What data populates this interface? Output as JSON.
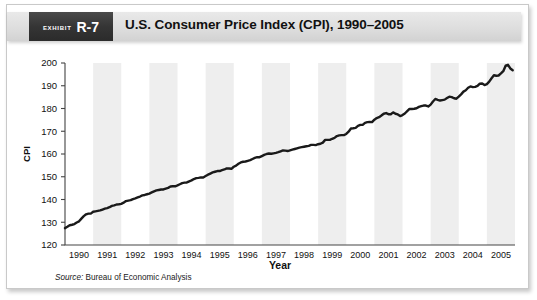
{
  "figure": {
    "exhibit_word": "Exhibit",
    "exhibit_number": "R-7",
    "title": "U.S. Consumer Price Index (CPI), 1990–2005",
    "source_label": "Source:",
    "source_text": "Bureau of Economic Analysis"
  },
  "chart_data": {
    "type": "line",
    "title": "U.S. Consumer Price Index (CPI), 1990–2005",
    "xlabel": "Year",
    "ylabel": "CPI",
    "xlim": [
      1990,
      2006
    ],
    "ylim": [
      120,
      200
    ],
    "ytick_labels": [
      "120",
      "130",
      "140",
      "150",
      "160",
      "170",
      "180",
      "190",
      "200"
    ],
    "yticks": [
      120,
      130,
      140,
      150,
      160,
      170,
      180,
      190,
      200
    ],
    "xtick_labels": [
      "1990",
      "1991",
      "1992",
      "1993",
      "1994",
      "1995",
      "1996",
      "1997",
      "1998",
      "1999",
      "2000",
      "2001",
      "2002",
      "2003",
      "2004",
      "2005"
    ],
    "xticks": [
      1990,
      1991,
      1992,
      1993,
      1994,
      1995,
      1996,
      1997,
      1998,
      1999,
      2000,
      2001,
      2002,
      2003,
      2004,
      2005
    ],
    "grid": false,
    "legend": "none",
    "banding": "alternating vertical year bands",
    "band_color": "#eeeeee",
    "line_color": "#1a1a1a",
    "line_width": 2.4,
    "series": [
      {
        "name": "CPI",
        "x": [
          1990.0,
          1990.083,
          1990.167,
          1990.25,
          1990.333,
          1990.417,
          1990.5,
          1990.583,
          1990.667,
          1990.75,
          1990.833,
          1990.917,
          1991.0,
          1991.083,
          1991.167,
          1991.25,
          1991.333,
          1991.417,
          1991.5,
          1991.583,
          1991.667,
          1991.75,
          1991.833,
          1991.917,
          1992.0,
          1992.083,
          1992.167,
          1992.25,
          1992.333,
          1992.417,
          1992.5,
          1992.583,
          1992.667,
          1992.75,
          1992.833,
          1992.917,
          1993.0,
          1993.083,
          1993.167,
          1993.25,
          1993.333,
          1993.417,
          1993.5,
          1993.583,
          1993.667,
          1993.75,
          1993.833,
          1993.917,
          1994.0,
          1994.083,
          1994.167,
          1994.25,
          1994.333,
          1994.417,
          1994.5,
          1994.583,
          1994.667,
          1994.75,
          1994.833,
          1994.917,
          1995.0,
          1995.083,
          1995.167,
          1995.25,
          1995.333,
          1995.417,
          1995.5,
          1995.583,
          1995.667,
          1995.75,
          1995.833,
          1995.917,
          1996.0,
          1996.083,
          1996.167,
          1996.25,
          1996.333,
          1996.417,
          1996.5,
          1996.583,
          1996.667,
          1996.75,
          1996.833,
          1996.917,
          1997.0,
          1997.083,
          1997.167,
          1997.25,
          1997.333,
          1997.417,
          1997.5,
          1997.583,
          1997.667,
          1997.75,
          1997.833,
          1997.917,
          1998.0,
          1998.083,
          1998.167,
          1998.25,
          1998.333,
          1998.417,
          1998.5,
          1998.583,
          1998.667,
          1998.75,
          1998.833,
          1998.917,
          1999.0,
          1999.083,
          1999.167,
          1999.25,
          1999.333,
          1999.417,
          1999.5,
          1999.583,
          1999.667,
          1999.75,
          1999.833,
          1999.917,
          2000.0,
          2000.083,
          2000.167,
          2000.25,
          2000.333,
          2000.417,
          2000.5,
          2000.583,
          2000.667,
          2000.75,
          2000.833,
          2000.917,
          2001.0,
          2001.083,
          2001.167,
          2001.25,
          2001.333,
          2001.417,
          2001.5,
          2001.583,
          2001.667,
          2001.75,
          2001.833,
          2001.917,
          2002.0,
          2002.083,
          2002.167,
          2002.25,
          2002.333,
          2002.417,
          2002.5,
          2002.583,
          2002.667,
          2002.75,
          2002.833,
          2002.917,
          2003.0,
          2003.083,
          2003.167,
          2003.25,
          2003.333,
          2003.417,
          2003.5,
          2003.583,
          2003.667,
          2003.75,
          2003.833,
          2003.917,
          2004.0,
          2004.083,
          2004.167,
          2004.25,
          2004.333,
          2004.417,
          2004.5,
          2004.583,
          2004.667,
          2004.75,
          2004.833,
          2004.917,
          2005.0,
          2005.083,
          2005.167,
          2005.25,
          2005.333,
          2005.417,
          2005.5,
          2005.583,
          2005.667,
          2005.75,
          2005.833,
          2005.917
        ],
        "values": [
          127.4,
          128.0,
          128.7,
          128.9,
          129.2,
          129.9,
          130.4,
          131.6,
          132.7,
          133.5,
          133.8,
          133.8,
          134.6,
          134.8,
          135.0,
          135.2,
          135.6,
          136.0,
          136.2,
          136.6,
          137.2,
          137.4,
          137.8,
          137.9,
          138.1,
          138.6,
          139.3,
          139.5,
          139.7,
          140.2,
          140.5,
          140.9,
          141.3,
          141.8,
          142.0,
          142.3,
          142.6,
          143.1,
          143.6,
          144.0,
          144.2,
          144.4,
          144.4,
          144.8,
          145.1,
          145.7,
          145.8,
          145.8,
          146.2,
          146.7,
          147.2,
          147.4,
          147.5,
          148.0,
          148.4,
          149.0,
          149.4,
          149.5,
          149.7,
          149.7,
          150.3,
          150.9,
          151.4,
          151.9,
          152.2,
          152.5,
          152.5,
          152.9,
          153.2,
          153.7,
          153.6,
          153.5,
          154.4,
          154.9,
          155.7,
          156.3,
          156.6,
          156.7,
          157.0,
          157.3,
          157.8,
          158.3,
          158.6,
          158.6,
          159.1,
          159.6,
          160.0,
          160.2,
          160.1,
          160.3,
          160.5,
          160.8,
          161.2,
          161.6,
          161.5,
          161.3,
          161.6,
          161.9,
          162.2,
          162.5,
          162.8,
          163.0,
          163.2,
          163.4,
          163.6,
          164.0,
          164.0,
          163.9,
          164.3,
          164.5,
          165.0,
          166.2,
          166.2,
          166.2,
          166.7,
          167.1,
          167.9,
          168.2,
          168.3,
          168.3,
          168.8,
          169.8,
          171.2,
          171.3,
          171.5,
          172.4,
          172.8,
          172.8,
          173.7,
          174.0,
          174.1,
          174.0,
          175.1,
          175.8,
          176.2,
          176.9,
          177.7,
          178.0,
          177.5,
          177.5,
          178.3,
          177.7,
          177.4,
          176.7,
          177.1,
          177.8,
          178.8,
          179.8,
          179.8,
          179.9,
          180.1,
          180.7,
          181.0,
          181.3,
          181.3,
          180.9,
          181.7,
          183.1,
          184.2,
          183.8,
          183.5,
          183.7,
          183.9,
          184.6,
          185.2,
          185.0,
          184.5,
          184.3,
          185.2,
          186.2,
          187.4,
          188.0,
          189.1,
          189.7,
          189.4,
          189.5,
          189.9,
          190.9,
          191.0,
          190.3,
          190.7,
          191.8,
          193.3,
          194.6,
          194.4,
          194.5,
          195.4,
          196.4,
          198.8,
          199.2,
          197.6,
          196.8
        ]
      }
    ]
  }
}
